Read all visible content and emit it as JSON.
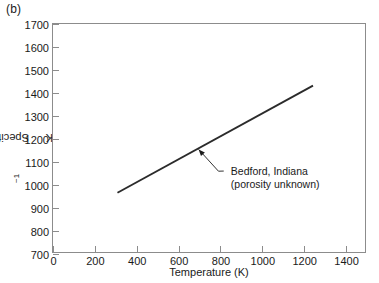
{
  "figure": {
    "panel_label": "(b)",
    "background": "#ffffff",
    "line_color": "#2b2b2b",
    "axis_color": "#8c8c8c",
    "text_color": "#1a1a1a"
  },
  "chart_data": {
    "type": "line",
    "title": "",
    "xlabel": "Temperature (K)",
    "ylabel": "Specific heat (J kg−1 K−1)",
    "ylabel_parts": {
      "prefix": "Specific heat (J kg",
      "sup1": "−1",
      "mid": " K",
      "sup2": "−1",
      "suffix": ")"
    },
    "xlim": [
      0,
      1500
    ],
    "ylim": [
      700,
      1700
    ],
    "xticks": [
      0,
      200,
      400,
      600,
      800,
      1000,
      1200,
      1400
    ],
    "xtick_labels": [
      "0",
      "200",
      "400",
      "600",
      "800",
      "1000",
      "1200",
      "1400"
    ],
    "yticks": [
      700,
      800,
      900,
      1000,
      1100,
      1200,
      1300,
      1400,
      1500,
      1600,
      1700
    ],
    "ytick_labels": [
      "700",
      "800",
      "900",
      "1000",
      "1100",
      "1200",
      "1300",
      "1400",
      "1500",
      "1600",
      "1700"
    ],
    "grid": false,
    "legend": false,
    "series": [
      {
        "name": "Bedford, Indiana (porosity unknown)",
        "x": [
          310,
          1250
        ],
        "values": [
          960,
          1430
        ]
      }
    ],
    "annotations": [
      {
        "text_line1": "Bedford, Indiana",
        "text_line2": "(porosity unknown)",
        "arrow_tip_x": 700,
        "arrow_tip_y": 1150,
        "text_anchor_x": 840,
        "text_anchor_y": 1055
      }
    ]
  }
}
